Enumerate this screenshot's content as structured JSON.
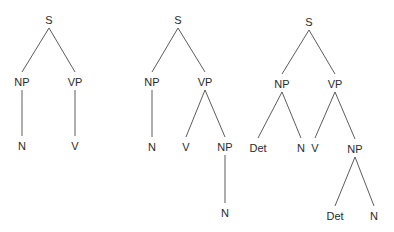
{
  "diagram": {
    "type": "syntax-trees",
    "trees": [
      {
        "id": "tree-1",
        "nodes": [
          {
            "id": "S",
            "label": "S",
            "x": 49,
            "y": 24
          },
          {
            "id": "NP",
            "label": "NP",
            "x": 22,
            "y": 86
          },
          {
            "id": "VP",
            "label": "VP",
            "x": 75,
            "y": 86
          },
          {
            "id": "N",
            "label": "N",
            "x": 22,
            "y": 150
          },
          {
            "id": "V",
            "label": "V",
            "x": 75,
            "y": 150
          }
        ],
        "edges": [
          [
            "S",
            "NP"
          ],
          [
            "S",
            "VP"
          ],
          [
            "NP",
            "N"
          ],
          [
            "VP",
            "V"
          ]
        ]
      },
      {
        "id": "tree-2",
        "nodes": [
          {
            "id": "S",
            "label": "S",
            "x": 178,
            "y": 24
          },
          {
            "id": "NP",
            "label": "NP",
            "x": 152,
            "y": 86
          },
          {
            "id": "VP",
            "label": "VP",
            "x": 205,
            "y": 86
          },
          {
            "id": "N",
            "label": "N",
            "x": 152,
            "y": 151
          },
          {
            "id": "V",
            "label": "V",
            "x": 186,
            "y": 151
          },
          {
            "id": "NP2",
            "label": "NP",
            "x": 225,
            "y": 151
          },
          {
            "id": "N2",
            "label": "N",
            "x": 225,
            "y": 217
          }
        ],
        "edges": [
          [
            "S",
            "NP"
          ],
          [
            "S",
            "VP"
          ],
          [
            "NP",
            "N"
          ],
          [
            "VP",
            "V"
          ],
          [
            "VP",
            "NP2"
          ],
          [
            "NP2",
            "N2"
          ]
        ]
      },
      {
        "id": "tree-3",
        "nodes": [
          {
            "id": "S",
            "label": "S",
            "x": 309,
            "y": 26
          },
          {
            "id": "NP",
            "label": "NP",
            "x": 282,
            "y": 88
          },
          {
            "id": "VP",
            "label": "VP",
            "x": 335,
            "y": 88
          },
          {
            "id": "Det",
            "label": "Det",
            "x": 258,
            "y": 152
          },
          {
            "id": "N",
            "label": "N",
            "x": 301,
            "y": 152
          },
          {
            "id": "V",
            "label": "V",
            "x": 315,
            "y": 152
          },
          {
            "id": "NP2",
            "label": "NP",
            "x": 355,
            "y": 153
          },
          {
            "id": "Det2",
            "label": "Det",
            "x": 335,
            "y": 220
          },
          {
            "id": "N2",
            "label": "N",
            "x": 374,
            "y": 220
          }
        ],
        "edges": [
          [
            "S",
            "NP"
          ],
          [
            "S",
            "VP"
          ],
          [
            "NP",
            "Det"
          ],
          [
            "NP",
            "N"
          ],
          [
            "VP",
            "V"
          ],
          [
            "VP",
            "NP2"
          ],
          [
            "NP2",
            "Det2"
          ],
          [
            "NP2",
            "N2"
          ]
        ]
      }
    ]
  }
}
